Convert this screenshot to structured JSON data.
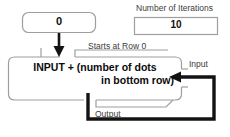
{
  "diagram": {
    "accumulator": {
      "name": "accumulator-box",
      "value": "0"
    },
    "iterations": {
      "label": "Number of Iterations",
      "value": "10"
    },
    "process": {
      "line1": "INPUT + (number of dots",
      "line2": "in bottom row)"
    },
    "annotations": {
      "starts_at_row": "Starts at Row 0",
      "input": "Input",
      "output": "Output"
    },
    "colors": {
      "box_border": "#9a9a9a",
      "flow_line": "#111111",
      "text": "#101010",
      "label_text": "#3a3a3a",
      "background": "#ffffff"
    },
    "icons": {
      "down_arrow": "arrow-down-icon",
      "left_arrow": "arrow-left-icon"
    }
  }
}
